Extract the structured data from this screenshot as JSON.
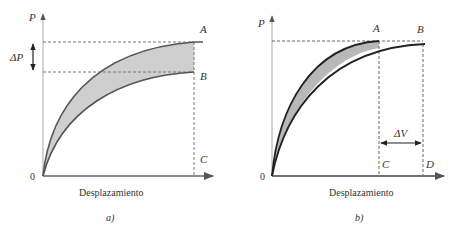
{
  "figure": {
    "panels": [
      {
        "id": "a",
        "caption": "a)",
        "y_axis_label": "P",
        "x_axis_label": "Desplazamiento",
        "origin_label": "0",
        "point_labels": [
          "A",
          "B",
          "C"
        ],
        "delta_label": "ΔP",
        "description": "Two load-displacement curves ending at same displacement; upper curve reaches A, lower reaches B; shaded region between curves; ΔP is vertical difference between A and B."
      },
      {
        "id": "b",
        "caption": "b)",
        "y_axis_label": "P",
        "x_axis_label": "Desplazamiento",
        "origin_label": "0",
        "point_labels": [
          "A",
          "B",
          "C",
          "D"
        ],
        "delta_label": "ΔV",
        "description": "Two load-displacement curves reaching roughly the same load; stiffer curve reaches A at smaller displacement C, softer curve reaches B at larger displacement D; ΔV is horizontal difference between C and D."
      }
    ],
    "colors": {
      "curve": "#555555",
      "shade": "#c8c8c8",
      "dashed": "#777777",
      "axis": "#666666"
    }
  }
}
